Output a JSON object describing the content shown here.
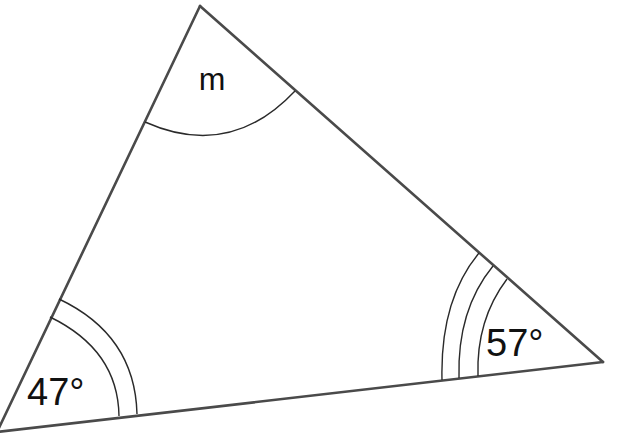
{
  "diagram": {
    "type": "triangle",
    "vertices": {
      "top": {
        "x": 200,
        "y": 6
      },
      "right": {
        "x": 603,
        "y": 362
      },
      "bottom_left": {
        "x": -3,
        "y": 432
      }
    },
    "angles": {
      "top": {
        "label": "m",
        "arc_count": 1
      },
      "bottom_left": {
        "label": "47°",
        "arc_count": 2
      },
      "right": {
        "label": "57°",
        "arc_count": 3
      }
    },
    "colors": {
      "edge": "#4a4a4a",
      "arc": "#2a2a2a",
      "text": "#111111",
      "background": "#ffffff"
    }
  }
}
